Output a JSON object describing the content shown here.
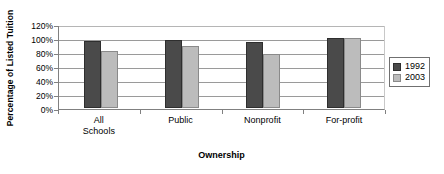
{
  "chart_data": {
    "type": "bar",
    "title": "",
    "xlabel": "Ownership",
    "ylabel": "Percentage of Listed Tuition",
    "categories": [
      "All Schools",
      "Public",
      "Nonprofit",
      "For-profit"
    ],
    "series": [
      {
        "name": "1992",
        "color": "#4a4a4a",
        "values": [
          96,
          97,
          94,
          100
        ]
      },
      {
        "name": "2003",
        "color": "#bcbcbc",
        "values": [
          82,
          88,
          77,
          100
        ]
      }
    ],
    "ylim": [
      0,
      120
    ],
    "ytick_labels": [
      "120%",
      "100%",
      "80%",
      "60%",
      "40%",
      "20%",
      "0%"
    ],
    "ytick_values": [
      120,
      100,
      80,
      60,
      40,
      20,
      0
    ],
    "grid": true,
    "legend_position": "right"
  },
  "legend": {
    "entries": [
      {
        "label": "1992"
      },
      {
        "label": "2003"
      }
    ]
  },
  "axes": {
    "y_title": "Percentage of Listed Tuition",
    "x_title": "Ownership"
  }
}
